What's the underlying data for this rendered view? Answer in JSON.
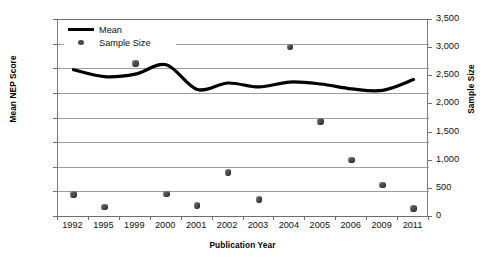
{
  "chart_data": {
    "type": "line",
    "title": "",
    "xlabel": "Publication Year",
    "ylabel": "Mean NEP Score",
    "y2label": "Sample Size",
    "categories": [
      "1992",
      "1995",
      "1999",
      "2000",
      "2001",
      "2002",
      "2003",
      "2004",
      "2005",
      "2006",
      "2009",
      "2011"
    ],
    "ylim": [
      1.0,
      5.0
    ],
    "yticks": [
      "1.00",
      "1.50",
      "2.00",
      "2.50",
      "3.00",
      "3.50",
      "4.00",
      "4.50",
      "5.00"
    ],
    "y2lim": [
      0,
      3500
    ],
    "y2ticks": [
      "0",
      "500",
      "1,000",
      "1,500",
      "2,000",
      "2,500",
      "3,000",
      "3,500"
    ],
    "grid": true,
    "legend_position": "top-left",
    "series": [
      {
        "name": "Mean",
        "axis": "left",
        "style": "smooth-line",
        "color": "#000000",
        "values": [
          3.97,
          3.83,
          3.88,
          4.07,
          3.57,
          3.7,
          3.62,
          3.72,
          3.68,
          3.58,
          3.55,
          3.77
        ]
      },
      {
        "name": "Sample Size",
        "axis": "right",
        "style": "markers",
        "color": "#4d4d4d",
        "values": [
          385,
          157,
          2712,
          394,
          184,
          770,
          289,
          3000,
          1680,
          998,
          551,
          131
        ]
      }
    ],
    "annotations": []
  },
  "legend": {
    "entries": [
      {
        "label": "Mean",
        "marker": "line-swatch"
      },
      {
        "label": "Sample Size",
        "marker": "dot-swatch"
      }
    ]
  },
  "axes": {
    "x_title": "Publication Year",
    "y_left_title": "Mean NEP Score",
    "y_right_title": "Sample Size"
  }
}
